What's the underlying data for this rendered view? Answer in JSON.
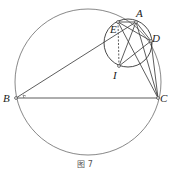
{
  "figure": {
    "caption": "图 7",
    "points": {
      "A": {
        "label": "A",
        "x": 136,
        "y": 22
      },
      "B": {
        "label": "B",
        "x": 16,
        "y": 98
      },
      "C": {
        "label": "C",
        "x": 158,
        "y": 98
      },
      "D": {
        "label": "D",
        "x": 151,
        "y": 41
      },
      "E": {
        "label": "E",
        "x": 118,
        "y": 22
      },
      "I": {
        "label": "I",
        "x": 119,
        "y": 66
      }
    },
    "circles": [
      {
        "name": "circumcircle-ABC",
        "cx": 88,
        "cy": 82,
        "r": 73
      },
      {
        "name": "circle-AEID",
        "cx": 128,
        "cy": 43,
        "r": 24
      }
    ],
    "colors": {
      "stroke": "#333333",
      "background": "#ffffff"
    }
  }
}
